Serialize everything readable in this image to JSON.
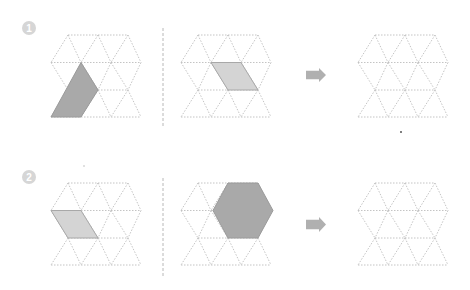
{
  "colors": {
    "grid_line": "#bdbdbd",
    "shape_dark": "#a9a9a9",
    "shape_dark_stroke": "#9a9a9a",
    "shape_light": "#d4d4d4",
    "shape_light_stroke": "#a8a8a8",
    "arrow": "#b0b0b0",
    "badge": "#d6d6d6",
    "badge_text": "#ffffff",
    "separator": "#b8b8b8"
  },
  "grid": {
    "side": 30,
    "rows_y_offsets": [
      0,
      27.5,
      55,
      82
    ],
    "row_points": [
      {
        "x_start": 17,
        "count": 3
      },
      {
        "x_start": 0,
        "count": 4
      },
      {
        "x_start": 17,
        "count": 3
      },
      {
        "x_start": 0,
        "count": 4
      }
    ]
  },
  "problems": [
    {
      "badge": "1",
      "badge_pos": [
        29,
        28
      ],
      "separator_x": 163,
      "separator_y": [
        28,
        128
      ],
      "arrow": {
        "x": 306,
        "y": 68,
        "w": 20,
        "h": 14
      },
      "panels": [
        {
          "name": "left-grid",
          "origin": [
            51,
            35
          ],
          "shapes": [
            {
              "name": "dark-parallelogram",
              "style": "dark",
              "points": [
                [
                  30,
                  27.5
                ],
                [
                  47,
                  55
                ],
                [
                  30,
                  82
                ],
                [
                  0,
                  82
                ]
              ]
            }
          ]
        },
        {
          "name": "middle-grid",
          "origin": [
            181,
            35
          ],
          "shapes": [
            {
              "name": "light-rhombus",
              "style": "light",
              "points": [
                [
                  30,
                  27.5
                ],
                [
                  60,
                  27.5
                ],
                [
                  77,
                  55
                ],
                [
                  47,
                  55
                ]
              ]
            }
          ]
        },
        {
          "name": "answer-grid",
          "origin": [
            358,
            35
          ],
          "shapes": []
        }
      ]
    },
    {
      "badge": "2",
      "badge_pos": [
        29,
        177
      ],
      "separator_x": 163,
      "separator_y": [
        178,
        278
      ],
      "arrow": {
        "x": 306,
        "y": 217,
        "w": 20,
        "h": 15
      },
      "panels": [
        {
          "name": "left-grid",
          "origin": [
            51,
            183
          ],
          "shapes": [
            {
              "name": "light-rhombus",
              "style": "light",
              "points": [
                [
                  0,
                  27.5
                ],
                [
                  30,
                  27.5
                ],
                [
                  47,
                  55
                ],
                [
                  17,
                  55
                ]
              ]
            }
          ]
        },
        {
          "name": "middle-grid",
          "origin": [
            181,
            183
          ],
          "shapes": [
            {
              "name": "dark-hexagon",
              "style": "dark",
              "points": [
                [
                  47,
                  0
                ],
                [
                  77,
                  0
                ],
                [
                  92,
                  27.5
                ],
                [
                  77,
                  55
                ],
                [
                  47,
                  55
                ],
                [
                  32,
                  27.5
                ]
              ]
            }
          ]
        },
        {
          "name": "answer-grid",
          "origin": [
            358,
            183
          ],
          "shapes": []
        }
      ]
    }
  ]
}
